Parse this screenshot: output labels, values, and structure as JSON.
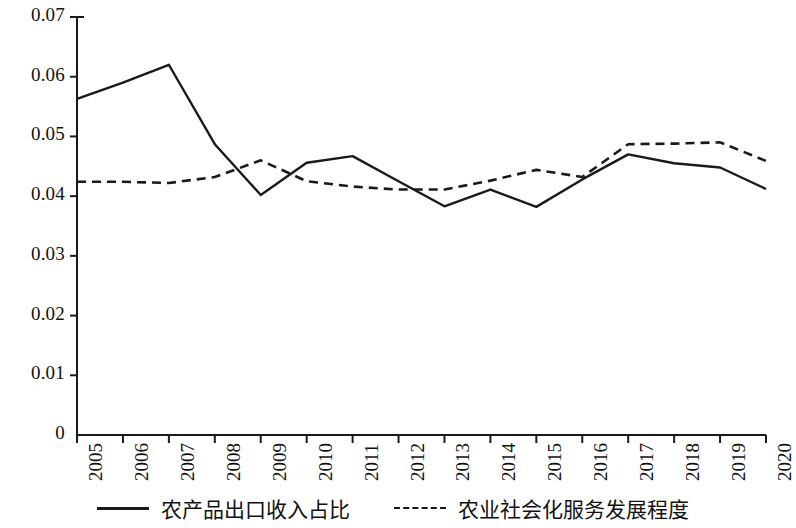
{
  "chart_data": {
    "type": "line",
    "title": "",
    "xlabel": "",
    "ylabel": "",
    "grid": false,
    "legend_position": "bottom",
    "ylim": [
      0,
      0.07
    ],
    "ytick_labels": [
      "0.07",
      "0.06",
      "0.05",
      "0.04",
      "0.03",
      "0.02",
      "0.01",
      "0"
    ],
    "ytick_values": [
      0.07,
      0.06,
      0.05,
      0.04,
      0.03,
      0.02,
      0.01,
      0
    ],
    "categories": [
      "2005",
      "2006",
      "2007",
      "2008",
      "2009",
      "2010",
      "2011",
      "2012",
      "2013",
      "2014",
      "2015",
      "2016",
      "2017",
      "2018",
      "2019",
      "2020"
    ],
    "series": [
      {
        "name": "农产品出口收入占比",
        "style": "solid",
        "color": "#1a1a1a",
        "values": [
          0.0563,
          0.059,
          0.062,
          0.0487,
          0.0402,
          0.0456,
          0.0467,
          0.0425,
          0.0383,
          0.0411,
          0.0382,
          0.0428,
          0.047,
          0.0455,
          0.0448,
          0.0412
        ]
      },
      {
        "name": "农业社会化服务发展程度",
        "style": "dashed",
        "color": "#1a1a1a",
        "values": [
          0.0424,
          0.0424,
          0.0422,
          0.0432,
          0.046,
          0.0425,
          0.0416,
          0.0411,
          0.0411,
          0.0426,
          0.0444,
          0.0432,
          0.0487,
          0.0488,
          0.049,
          0.0459
        ]
      }
    ]
  },
  "legend": {
    "entries": [
      {
        "label": "农产品出口收入占比",
        "style": "solid"
      },
      {
        "label": "农业社会化服务发展程度",
        "style": "dashed"
      }
    ]
  }
}
